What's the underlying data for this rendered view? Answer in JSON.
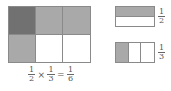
{
  "main_grid": {
    "rows": 2,
    "columns": 3,
    "cells": [
      [
        "dark",
        "light",
        "light"
      ],
      [
        "light",
        "white",
        "white"
      ]
    ]
  },
  "formula": {
    "a": {
      "num": "1",
      "den": "2"
    },
    "times": "×",
    "b": {
      "num": "1",
      "den": "3"
    },
    "equals": "=",
    "result": {
      "num": "1",
      "den": "6"
    }
  },
  "half_model": {
    "label": {
      "num": "1",
      "den": "2"
    },
    "parts": 2,
    "shaded": 1
  },
  "third_model": {
    "label": {
      "num": "1",
      "den": "3"
    },
    "parts": 3,
    "shaded": 1
  },
  "colors": {
    "dark": "#717171",
    "light": "#a9a9a9",
    "border": "#8a8a8a"
  }
}
